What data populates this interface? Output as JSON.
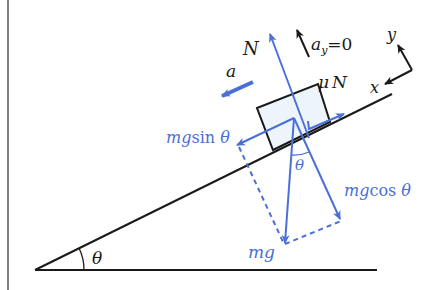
{
  "diagram": {
    "type": "free-body-diagram",
    "colors": {
      "structure": "#1a1a1a",
      "force": "#4a6fd8",
      "block_fill": "#eef4fb",
      "background": "#ffffff"
    },
    "labels": {
      "normal": "N",
      "accel_y": "a",
      "accel_y_sub": "y",
      "accel_y_eq": "=0",
      "axis_y": "y",
      "axis_x": "x",
      "friction_mu": "μ",
      "friction_N": "N",
      "accel": "a",
      "parallel_m": "mg",
      "parallel_fn": "sin ",
      "parallel_theta": "θ",
      "perp_m": "mg",
      "perp_fn": "cos ",
      "perp_theta": "θ",
      "weight": "mg",
      "angle_at_block": "θ",
      "incline_angle": "θ"
    }
  }
}
